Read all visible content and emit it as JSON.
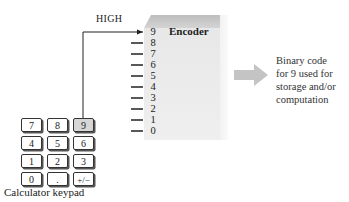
{
  "encoder": {
    "title": "Encoder",
    "inputs": [
      "9",
      "8",
      "7",
      "6",
      "5",
      "4",
      "3",
      "2",
      "1",
      "0"
    ],
    "active_input": "9",
    "active_signal_label": "HIGH"
  },
  "keypad": {
    "caption": "Calculator keypad",
    "rows": [
      [
        "7",
        "8",
        "9"
      ],
      [
        "4",
        "5",
        "6"
      ],
      [
        "1",
        "2",
        "3"
      ],
      [
        "0",
        ".",
        "+/−"
      ]
    ],
    "pressed_key": "9"
  },
  "output": {
    "lines": [
      "Binary code",
      "for 9 used for",
      "storage and/or",
      "computation"
    ]
  },
  "colors": {
    "box_front": "#ececec",
    "box_top": "#c8c8c8",
    "arrow": "#c4c4c4",
    "line": "#222222",
    "pressed_key": "#d6d6d6"
  }
}
